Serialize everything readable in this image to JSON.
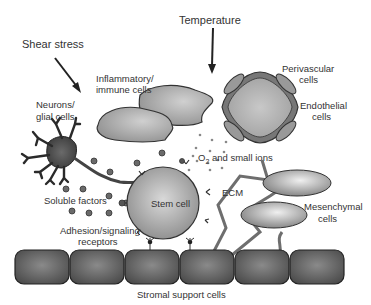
{
  "diagram": {
    "labels": {
      "shear_stress": "Shear stress",
      "temperature": "Temperature",
      "inflammatory_1": "Inflammatory/",
      "inflammatory_2": "immune cells",
      "perivascular_1": "Perivascular",
      "perivascular_2": "cells",
      "endothelial_1": "Endothelial",
      "endothelial_2": "cells",
      "neurons_1": "Neurons/",
      "neurons_2": "glial cells",
      "o2_prefix": "O",
      "o2_sub": "2",
      "o2_suffix": " and small ions",
      "soluble_factors": "Soluble factors",
      "stem_cell": "Stem cell",
      "ecm": "ECM",
      "mesenchymal_1": "Mesenchymal",
      "mesenchymal_2": "cells",
      "adhesion_1": "Adhesion/signaling",
      "adhesion_2": "receptors",
      "stromal": "Stromal support cells"
    },
    "colors": {
      "stroke": "#333333",
      "cell_dark": "#555555",
      "cell_mid": "#8a8a8a",
      "cell_light": "#c8c8c8",
      "text": "#333333"
    },
    "stromal_cell_count": 6
  }
}
